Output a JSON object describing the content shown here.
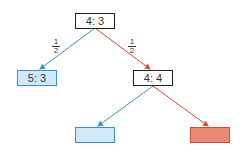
{
  "diagram": {
    "type": "probability-tree",
    "colors": {
      "blue": "#3f8fc7",
      "red": "#d44a35",
      "blue_fill": "#cfe9f8",
      "red_fill": "#e98a78",
      "black": "#222222"
    },
    "nodes": {
      "root": {
        "label": "4: 3"
      },
      "left": {
        "label": "5: 3"
      },
      "right": {
        "label": "4: 4"
      },
      "right_left": {
        "label": ""
      },
      "right_right": {
        "label": ""
      }
    },
    "edges": {
      "root_left": {
        "prob_num": "1",
        "prob_den": "2"
      },
      "root_right": {
        "prob_num": "1",
        "prob_den": "2"
      }
    }
  }
}
